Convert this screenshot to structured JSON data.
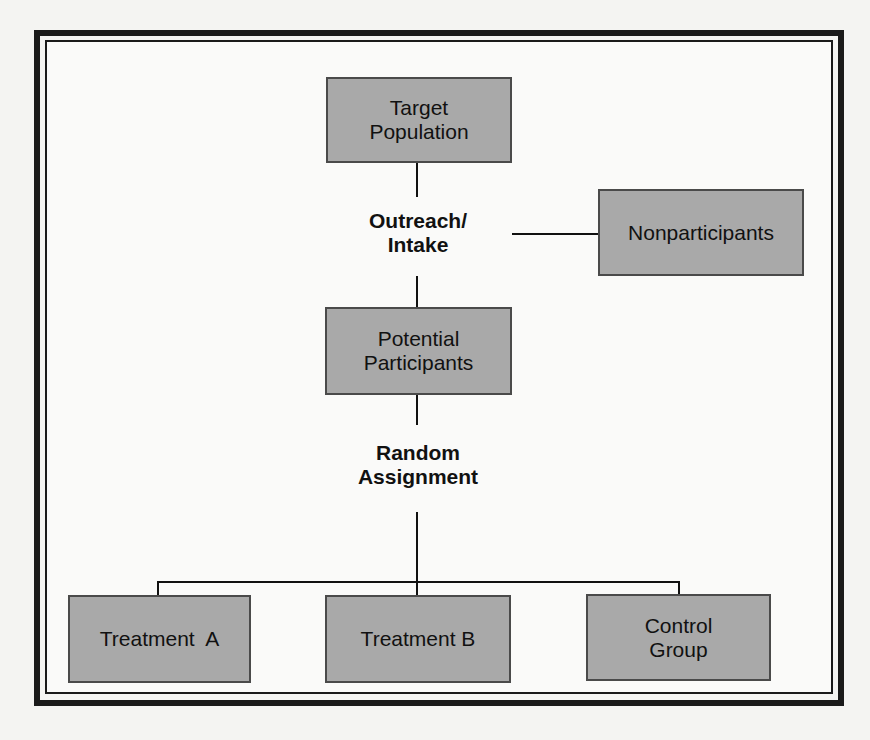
{
  "diagram": {
    "title": "",
    "nodes": {
      "target_population": {
        "line1": "Target",
        "line2": "Population"
      },
      "nonparticipants": {
        "label": "Nonparticipants"
      },
      "potential_participants": {
        "line1": "Potential",
        "line2": "Participants"
      },
      "treatment_a": {
        "label": "Treatment  A"
      },
      "treatment_b": {
        "label": "Treatment B"
      },
      "control_group": {
        "line1": "Control",
        "line2": "Group"
      }
    },
    "step_labels": {
      "outreach_intake": {
        "line1": "Outreach/",
        "line2": "Intake"
      },
      "random_assignment": {
        "line1": "Random",
        "line2": "Assignment"
      }
    },
    "colors": {
      "box_fill": "#a9a9a9",
      "box_border": "#4a4a4a",
      "frame": "#1a1a1a",
      "background": "#fafaf9"
    },
    "edges": [
      [
        "target_population",
        "outreach_intake"
      ],
      [
        "outreach_intake",
        "nonparticipants"
      ],
      [
        "outreach_intake",
        "potential_participants"
      ],
      [
        "potential_participants",
        "random_assignment"
      ],
      [
        "random_assignment",
        "treatment_a"
      ],
      [
        "random_assignment",
        "treatment_b"
      ],
      [
        "random_assignment",
        "control_group"
      ]
    ]
  }
}
